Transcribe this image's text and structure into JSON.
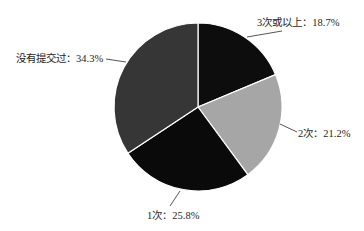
{
  "chart_data": {
    "type": "pie",
    "title": "",
    "categories": [
      "3次或以上",
      "2次",
      "1次",
      "没有提交过"
    ],
    "values": [
      18.7,
      21.2,
      25.8,
      34.3
    ],
    "unit": "%",
    "labels": [
      "3次或以上：18.7%",
      "2次：21.2%",
      "1次：25.8%",
      "没有提交过：34.3%"
    ],
    "colors": [
      "#0d0d0d",
      "#a6a6a6",
      "#0a0a0a",
      "#363636"
    ],
    "start_angle_deg": 90,
    "direction": "clockwise",
    "legend": "none",
    "data_labels": "outside with leader lines"
  }
}
